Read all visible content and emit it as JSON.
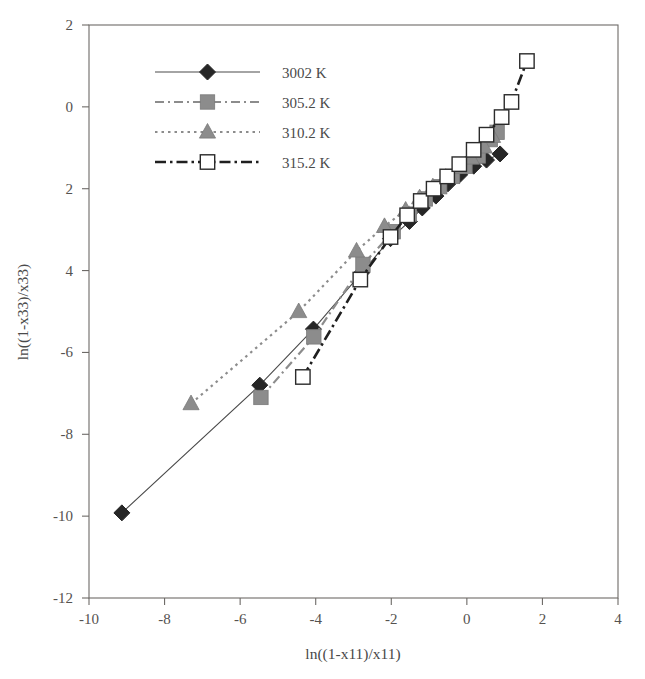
{
  "figure": {
    "width": 645,
    "height": 679,
    "background": "#ffffff"
  },
  "chart_data": {
    "type": "scatter",
    "title": "",
    "subtitle": "",
    "xlabel": "ln((1-x11)/x11)",
    "ylabel": "ln((1-x33)/x33)",
    "xlim": [
      -10,
      4
    ],
    "ylim": [
      -12,
      2
    ],
    "xticks": [
      -10,
      -8,
      -6,
      -4,
      -2,
      0,
      2,
      4
    ],
    "yticks": [
      2,
      0,
      -2,
      -4,
      -6,
      -8,
      -10,
      -12
    ],
    "xtick_labels": [
      "-10",
      "-8",
      "-6",
      "-4",
      "-2",
      "0",
      "2",
      "4"
    ],
    "ytick_labels": [
      "2",
      "0",
      "2",
      "4",
      "-6",
      "-8",
      "-10",
      "-12"
    ],
    "grid": false,
    "legend_position": "upper-left-inset",
    "frame": true,
    "series": [
      {
        "name": "3002  K",
        "marker": "filled-diamond",
        "color": "#262626",
        "line_style": "solid",
        "points": [
          [
            -9.13,
            -9.92
          ],
          [
            -5.48,
            -6.8
          ],
          [
            -4.06,
            -5.43
          ],
          [
            -2.78,
            -4.05
          ],
          [
            -2.02,
            -3.22
          ],
          [
            -1.52,
            -2.8
          ],
          [
            -1.18,
            -2.47
          ],
          [
            -0.82,
            -2.18
          ],
          [
            -0.5,
            -1.88
          ],
          [
            -0.19,
            -1.66
          ],
          [
            0.18,
            -1.45
          ],
          [
            0.52,
            -1.3
          ],
          [
            0.88,
            -1.15
          ]
        ]
      },
      {
        "name": "305.2  K",
        "marker": "filled-square",
        "color": "#8c8c8c",
        "line_style": "long-dash-dot",
        "points": [
          [
            -5.45,
            -7.1
          ],
          [
            -4.05,
            -5.62
          ],
          [
            -2.75,
            -3.85
          ],
          [
            -1.95,
            -3.05
          ],
          [
            -1.52,
            -2.62
          ],
          [
            -1.1,
            -2.25
          ],
          [
            -0.72,
            -1.95
          ],
          [
            -0.38,
            -1.7
          ],
          [
            -0.05,
            -1.45
          ],
          [
            0.3,
            -1.2
          ],
          [
            0.62,
            -0.8
          ],
          [
            0.8,
            -0.62
          ]
        ]
      },
      {
        "name": "310.2  K",
        "marker": "filled-triangle",
        "color": "#8c8c8c",
        "line_style": "dotted",
        "points": [
          [
            -7.3,
            -7.25
          ],
          [
            -4.45,
            -5.0
          ],
          [
            -2.92,
            -3.52
          ],
          [
            -2.18,
            -2.92
          ],
          [
            -1.62,
            -2.52
          ],
          [
            -1.25,
            -2.22
          ],
          [
            -0.9,
            -1.95
          ],
          [
            -0.56,
            -1.72
          ],
          [
            -0.22,
            -1.48
          ],
          [
            0.12,
            -1.25
          ],
          [
            0.46,
            -0.98
          ],
          [
            0.68,
            -0.72
          ]
        ]
      },
      {
        "name": "315.2  K",
        "marker": "open-square",
        "color": "#1a1a1a",
        "line_style": "dash-dot",
        "points": [
          [
            -4.34,
            -6.6
          ],
          [
            -2.82,
            -4.22
          ],
          [
            -2.02,
            -3.18
          ],
          [
            -1.58,
            -2.65
          ],
          [
            -1.22,
            -2.3
          ],
          [
            -0.88,
            -2.0
          ],
          [
            -0.52,
            -1.7
          ],
          [
            -0.2,
            -1.4
          ],
          [
            0.18,
            -1.05
          ],
          [
            0.52,
            -0.68
          ],
          [
            0.92,
            -0.25
          ],
          [
            1.18,
            0.12
          ],
          [
            1.59,
            1.12
          ]
        ]
      }
    ]
  },
  "legend": {
    "entries": [
      {
        "label": "3002  K",
        "marker": "filled-diamond",
        "style": "solid"
      },
      {
        "label": "305.2  K",
        "marker": "filled-square",
        "style": "long-dash-dot"
      },
      {
        "label": "310.2  K",
        "marker": "filled-triangle",
        "style": "dotted"
      },
      {
        "label": "315.2  K",
        "marker": "open-square",
        "style": "dash-dot"
      }
    ]
  },
  "colors": {
    "axis": "#6d6a67",
    "text": "#4a4a4a",
    "dark_marker": "#262626",
    "gray_marker": "#8c8c8c",
    "background": "#ffffff"
  }
}
